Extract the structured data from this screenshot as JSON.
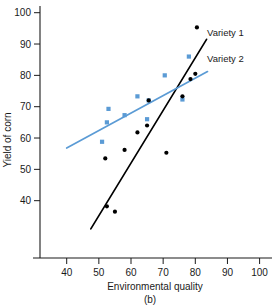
{
  "figure": {
    "panel_label": "(b)",
    "x_axis": {
      "title": "Environmental quality",
      "ticks": [
        40,
        50,
        60,
        70,
        80,
        90,
        100
      ],
      "tick_labels": [
        "40",
        "50",
        "60",
        "70",
        "80",
        "90",
        "100"
      ]
    },
    "y_axis": {
      "title": "Yield of corn",
      "ticks": [
        40,
        50,
        60,
        70,
        80,
        90,
        100
      ],
      "tick_labels": [
        "40",
        "50",
        "60",
        "70",
        "80",
        "90",
        "100"
      ]
    },
    "legend": {
      "series1_label": "Variety 1",
      "series2_label": "Variety 2"
    },
    "colors": {
      "variety1": "#000000",
      "variety2": "#5b9bd5",
      "axis": "#1a1a1a"
    }
  },
  "chart_data": {
    "type": "scatter",
    "title": "",
    "xlabel": "Environmental quality",
    "ylabel": "Yield of corn",
    "xlim": [
      32,
      104
    ],
    "ylim": [
      29,
      103
    ],
    "xticks": [
      40,
      50,
      60,
      70,
      80,
      90,
      100
    ],
    "yticks": [
      40,
      50,
      60,
      70,
      80,
      90,
      100
    ],
    "grid": false,
    "legend_position": "upper-right-inside",
    "annotations": [
      "(b)"
    ],
    "series": [
      {
        "name": "Variety 1",
        "color": "#000000",
        "marker": "filled-circle",
        "points": [
          [
            52.0,
            53.5
          ],
          [
            52.5,
            38.2
          ],
          [
            55.0,
            36.5
          ],
          [
            58.0,
            56.2
          ],
          [
            62.0,
            61.8
          ],
          [
            65.0,
            64.0
          ],
          [
            65.5,
            72.0
          ],
          [
            71.0,
            55.3
          ],
          [
            76.0,
            73.3
          ],
          [
            78.5,
            78.8
          ],
          [
            80.0,
            80.5
          ],
          [
            80.5,
            95.3
          ]
        ],
        "fit_line": {
          "x1": 47.5,
          "y1": 31.0,
          "x2": 83.5,
          "y2": 91.5
        }
      },
      {
        "name": "Variety 2",
        "color": "#5b9bd5",
        "marker": "filled-square",
        "points": [
          [
            51.0,
            58.8
          ],
          [
            52.5,
            65.0
          ],
          [
            53.0,
            69.3
          ],
          [
            58.0,
            67.3
          ],
          [
            62.0,
            73.3
          ],
          [
            65.0,
            66.0
          ],
          [
            65.5,
            72.0
          ],
          [
            70.5,
            80.0
          ],
          [
            76.0,
            72.3
          ],
          [
            78.0,
            86.0
          ]
        ],
        "fit_line": {
          "x1": 40.0,
          "y1": 56.8,
          "x2": 83.8,
          "y2": 81.2
        }
      }
    ]
  }
}
